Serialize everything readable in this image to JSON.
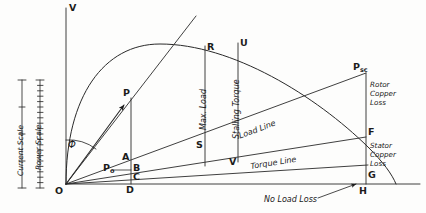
{
  "figure": {
    "type": "induction-motor-circle-diagram",
    "background": "#fdfdfc",
    "ink": "#1b1b1b"
  },
  "axes": {
    "vertical_label": "V",
    "origin_label": "O",
    "horizontal_axis_name": "output-line"
  },
  "scales": [
    {
      "id": "current-scale",
      "label": "Current Scale",
      "ticks": 4
    },
    {
      "id": "power-scale",
      "label": "Power Scale",
      "ticks": 20
    }
  ],
  "angle": {
    "symbol": "Φ",
    "name": "phi-angle"
  },
  "points": [
    {
      "id": "P",
      "label": "P",
      "sub": ""
    },
    {
      "id": "P0",
      "label": "P",
      "sub": "o"
    },
    {
      "id": "Psc",
      "label": "P",
      "sub": "sc"
    },
    {
      "id": "R",
      "label": "R",
      "sub": ""
    },
    {
      "id": "U",
      "label": "U",
      "sub": ""
    },
    {
      "id": "S",
      "label": "S",
      "sub": ""
    },
    {
      "id": "V",
      "label": "V",
      "sub": ""
    },
    {
      "id": "A",
      "label": "A",
      "sub": ""
    },
    {
      "id": "B",
      "label": "B",
      "sub": ""
    },
    {
      "id": "C",
      "label": "C",
      "sub": ""
    },
    {
      "id": "D",
      "label": "D",
      "sub": ""
    },
    {
      "id": "F",
      "label": "F",
      "sub": ""
    },
    {
      "id": "G",
      "label": "G",
      "sub": ""
    },
    {
      "id": "H",
      "label": "H",
      "sub": ""
    }
  ],
  "annotations": {
    "max_load": "Max. Load",
    "stalling_torque": "Stalling Torque",
    "load_line": "Load Line",
    "torque_line": "Torque Line",
    "rotor_copper_loss": "Rotor\nCopper\nLoss",
    "rotor_copper_loss_lines": [
      "Rotor",
      "Copper",
      "Loss"
    ],
    "stator_copper_loss_lines": [
      "Stator",
      "Copper",
      "Loss"
    ],
    "no_load_loss": "No Load Loss"
  }
}
